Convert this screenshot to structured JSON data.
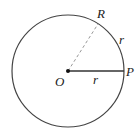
{
  "diagram": {
    "labels": {
      "center": "O",
      "point_p": "P",
      "point_r": "R",
      "radius_label": "r",
      "arc_label": "r"
    },
    "colors": {
      "stroke": "#444444",
      "dashed": "#999999",
      "text": "#222222"
    }
  }
}
